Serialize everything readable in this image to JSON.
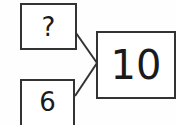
{
  "diagram": {
    "type": "number-bond",
    "parts": [
      {
        "label": "?",
        "position": "top-left"
      },
      {
        "label": "6",
        "position": "bottom-left"
      }
    ],
    "whole": {
      "label": "10",
      "position": "right"
    },
    "colors": {
      "stroke": "#333333",
      "text": "#1a1a1a",
      "background": "#ffffff"
    }
  }
}
